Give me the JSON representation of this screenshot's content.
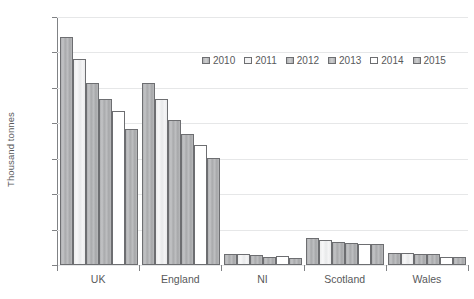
{
  "chart_data": {
    "type": "bar",
    "title": "",
    "subtitle": "",
    "xlabel": "",
    "ylabel": "Thousand tonnes",
    "categories": [
      "UK",
      "England",
      "NI",
      "Scotland",
      "Wales"
    ],
    "ylim": [
      0,
      14000
    ],
    "ytick_step": 2000,
    "yticks": [
      0,
      2000,
      4000,
      6000,
      8000,
      10000,
      12000,
      14000
    ],
    "ytick_labels": [
      "0",
      "2000",
      "4000",
      "6000",
      "8000",
      "10000",
      "12000",
      "14000"
    ],
    "grid": true,
    "legend_position": "top-center",
    "series": [
      {
        "name": "2010",
        "values": [
          12900,
          10300,
          650,
          1540,
          680
        ]
      },
      {
        "name": "2011",
        "values": [
          11650,
          9350,
          600,
          1430,
          660
        ]
      },
      {
        "name": "2012",
        "values": [
          10300,
          8200,
          560,
          1320,
          650
        ]
      },
      {
        "name": "2013",
        "values": [
          9350,
          7400,
          480,
          1240,
          620
        ]
      },
      {
        "name": "2014",
        "values": [
          8700,
          6800,
          520,
          1210,
          450
        ]
      },
      {
        "name": "2015",
        "values": [
          7700,
          6050,
          420,
          1180,
          430
        ]
      }
    ]
  },
  "legend": {
    "items": [
      {
        "label": "2010",
        "shade": "shade-dark"
      },
      {
        "label": "2011",
        "shade": "shade-light"
      },
      {
        "label": "2012",
        "shade": "shade-dark"
      },
      {
        "label": "2013",
        "shade": "shade-dark"
      },
      {
        "label": "2014",
        "shade": "shade-white"
      },
      {
        "label": "2015",
        "shade": "shade-dark"
      }
    ]
  },
  "colors": {
    "gridline": "#e6e7e8",
    "axis": "#808285",
    "text": "#58595b",
    "bar_border": "#6d6e71",
    "bar_dark": "#b3b4b6",
    "bar_light": "#f0f0f1",
    "bar_white": "#ffffff",
    "background": "#ffffff"
  }
}
